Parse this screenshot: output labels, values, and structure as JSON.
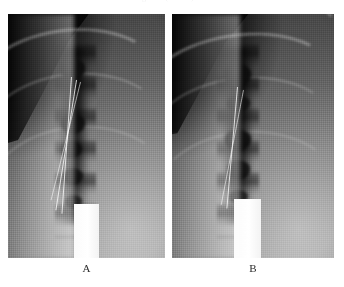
{
  "figure": {
    "caption_sliver": "the barium column and the narrowed segment (arrows).",
    "panels": [
      {
        "id": "A",
        "label": "A",
        "alt": "Oblique chest radiograph, left panel, showing vertebral column with dark mediastinal air/contrast column and thin catheter wires overlying the spine",
        "modality": "radiograph"
      },
      {
        "id": "B",
        "label": "B",
        "alt": "Oblique chest radiograph, right panel, comparison view showing the same region with dark segmental defects along the column",
        "modality": "radiograph"
      }
    ]
  },
  "colors": {
    "page_background": "#ffffff",
    "label_text": "#2b2b2b",
    "film_dark": "#070707",
    "film_mid": "#9a9a9a",
    "film_bright": "#ffffff"
  },
  "icons": {
    "panel_a_marker": "letter-a-marker",
    "panel_b_marker": "letter-b-marker"
  }
}
